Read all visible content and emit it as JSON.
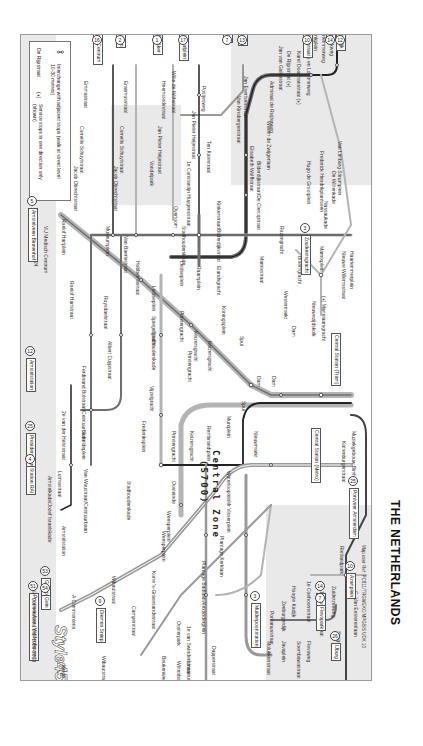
{
  "country_title": "THE NETHERLANDS",
  "zone_label": "Central Zone",
  "zone_code": "(5700)",
  "map_reference": "Map user Ref: PC811/TRGWEKC/MPGB/S UDK 10",
  "legend": {
    "interchange_icon": "interchange-icon",
    "interchange_text": "Interchange with adjacent stops (walk at street level 10-30 metres)",
    "one_direction_example": "De Rijpstraat",
    "one_direction_marker": "(+)",
    "one_direction_text": "Service stops in one direction only (shown)"
  },
  "credit": {
    "company": "A Commenteris",
    "brand": "Style45",
    "brand_suffix": "design",
    "copyright": "© Commenteris Ltd. 1989-2008"
  },
  "terminals": [
    {
      "name": "Station Sloterdijk",
      "line": "12",
      "x": 335,
      "y": 6
    },
    {
      "name": "Sloterweer",
      "line": "14",
      "x": 325,
      "y": 10
    },
    {
      "name": "Van Hallstraat",
      "line": "10",
      "x": 302,
      "y": 20
    },
    {
      "name": "Zoutkeetsgracht",
      "line": "3",
      "x": 300,
      "y": 232
    },
    {
      "name": "Geuzenveld",
      "line": "13",
      "x": 237,
      "y": 12
    },
    {
      "name": "Slotermeer",
      "line": "7",
      "x": 222,
      "y": 12
    },
    {
      "name": "Osdorp Dijkgraafplein",
      "line": "17",
      "x": 178,
      "y": 6
    },
    {
      "name": "Osdorp De Aker",
      "line": "1",
      "x": 152,
      "y": 12
    },
    {
      "name": "Nieuw Sloten",
      "line": "2",
      "x": 115,
      "y": 12
    },
    {
      "name": "VU Medisch Centrum",
      "line": "16",
      "x": 92,
      "y": 10
    },
    {
      "name": "Amstelveen Binnenhof",
      "line": "5",
      "x": 27,
      "y": 205
    },
    {
      "name": "Amstelstation",
      "line": "12",
      "x": 25,
      "y": 355
    },
    {
      "name": "President Kennedylaan",
      "line": "25",
      "x": 25,
      "y": 430
    },
    {
      "name": "Station RAI",
      "line": "4",
      "x": 25,
      "y": 463
    },
    {
      "name": "Gaasperplas",
      "line": "53",
      "x": 40,
      "y": 575
    },
    {
      "name": "Gein",
      "line": "54",
      "x": 40,
      "y": 592
    },
    {
      "name": "Poortwachter (Middenhoven)",
      "line": "51",
      "x": 28,
      "y": 590
    },
    {
      "name": "Diemen Sniep",
      "line": "9",
      "x": 95,
      "y": 605
    },
    {
      "name": "Muiderpoortstation",
      "line": "3",
      "x": 250,
      "y": 600
    },
    {
      "name": "Flevopark",
      "line": "14",
      "x": 315,
      "y": 590
    },
    {
      "name": "Flevopark",
      "line": "7",
      "x": 315,
      "y": 602
    },
    {
      "name": "IJburg",
      "line": "26",
      "x": 330,
      "y": 640
    },
    {
      "name": "Azartplein",
      "line": "10",
      "x": 345,
      "y": 570
    },
    {
      "name": "Pontveer Amsterdam",
      "line": "25",
      "x": 348,
      "y": 485
    },
    {
      "name": "Central Station (Tram)",
      "line": "",
      "x": 330,
      "y": 330
    },
    {
      "name": "Central Station (Metro)",
      "line": "",
      "x": 310,
      "y": 425
    }
  ],
  "stations": [
    {
      "name": "Kingbeekweg",
      "x": 328,
      "y": 25
    },
    {
      "name": "Haarlemmerweg",
      "x": 320,
      "y": 25
    },
    {
      "name": "Willinkplein",
      "x": 312,
      "y": 25
    },
    {
      "name": "Bos en Lommerweg",
      "x": 305,
      "y": 50
    },
    {
      "name": "Karel Doormanstraat (+)",
      "x": 295,
      "y": 50
    },
    {
      "name": "De Rijpstraat (+)",
      "x": 285,
      "y": 50
    },
    {
      "name": "Jan van Galenstraat",
      "x": 277,
      "y": 45
    },
    {
      "name": "Admiraal de Ruijterweg",
      "x": 268,
      "y": 80
    },
    {
      "name": "Willem de Zwijgerlaan",
      "x": 265,
      "y": 120
    },
    {
      "name": "Bilderdijkstraat/De Clercqstraat",
      "x": 255,
      "y": 160
    },
    {
      "name": "Jan Evertsenstraat",
      "x": 242,
      "y": 75
    },
    {
      "name": "Van Kinsbergenstraat",
      "x": 235,
      "y": 95
    },
    {
      "name": "Elisabeth Wolffstraat",
      "x": 248,
      "y": 145
    },
    {
      "name": "Van Limburg Stirumplein",
      "x": 336,
      "y": 140
    },
    {
      "name": "De Wittenkade",
      "x": 330,
      "y": 170
    },
    {
      "name": "Frederick Hendrikplantsoen",
      "x": 318,
      "y": 150
    },
    {
      "name": "Hugo de Grootplein",
      "x": 305,
      "y": 160
    },
    {
      "name": "Nassaukade",
      "x": 322,
      "y": 200
    },
    {
      "name": "Marnixplein",
      "x": 318,
      "y": 245
    },
    {
      "name": "Haarlemmerplein",
      "x": 348,
      "y": 250
    },
    {
      "name": "Nieuwe Willemsstraat",
      "x": 340,
      "y": 250
    },
    {
      "name": "Rozengracht",
      "x": 278,
      "y": 225
    },
    {
      "name": "Bloemgracht",
      "x": 296,
      "y": 255
    },
    {
      "name": "Marnixstraat",
      "x": 258,
      "y": 255
    },
    {
      "name": "(+) Martelaarsgracht",
      "x": 320,
      "y": 295
    },
    {
      "name": "Nieuwezijdskolk",
      "x": 310,
      "y": 300
    },
    {
      "name": "Westermarkt",
      "x": 282,
      "y": 290
    },
    {
      "name": "Dam",
      "x": 290,
      "y": 325
    },
    {
      "name": "Dam",
      "x": 270,
      "y": 375
    },
    {
      "name": "Dam",
      "x": 255,
      "y": 375
    },
    {
      "name": "Spui",
      "x": 238,
      "y": 335
    },
    {
      "name": "Spui",
      "x": 240,
      "y": 400
    },
    {
      "name": "Nieuwmarkt",
      "x": 252,
      "y": 430
    },
    {
      "name": "Mr Visserplein",
      "x": 225,
      "y": 500
    },
    {
      "name": "Kattenburgerstraat",
      "x": 340,
      "y": 440
    },
    {
      "name": "Muziekgebouw Bimhuis",
      "x": 350,
      "y": 430
    },
    {
      "name": "Rietlandpark",
      "x": 338,
      "y": 545
    },
    {
      "name": "C. Van Eesterenlaan",
      "x": 352,
      "y": 590
    },
    {
      "name": "Zuiderzeeweg",
      "x": 330,
      "y": 585
    },
    {
      "name": "1e Leeghwaterstraat",
      "x": 318,
      "y": 590
    },
    {
      "name": "Steigereiland",
      "x": 335,
      "y": 630
    },
    {
      "name": "1e Coehoornstraat",
      "x": 305,
      "y": 580
    },
    {
      "name": "Hoogte Kadijk",
      "x": 290,
      "y": 585
    },
    {
      "name": "Zeeburgerdijk",
      "x": 280,
      "y": 600
    },
    {
      "name": "Pontanusstraat",
      "x": 268,
      "y": 610
    },
    {
      "name": "Soembawastraat",
      "x": 295,
      "y": 640
    },
    {
      "name": "Javaplein",
      "x": 280,
      "y": 640
    },
    {
      "name": "Molukkenstraat",
      "x": 265,
      "y": 640
    },
    {
      "name": "Flevoweg",
      "x": 305,
      "y": 640
    },
    {
      "name": "Dapperstraat",
      "x": 210,
      "y": 645
    },
    {
      "name": "Linnaeusstraat",
      "x": 185,
      "y": 660
    },
    {
      "name": "Wittenbachstraat",
      "x": 175,
      "y": 660
    },
    {
      "name": "Beukenweg",
      "x": 160,
      "y": 655
    },
    {
      "name": "Oosterpark",
      "x": 175,
      "y": 620
    },
    {
      "name": "1e van Swindenstraat",
      "x": 185,
      "y": 625
    },
    {
      "name": "Alexanderplein",
      "x": 200,
      "y": 600
    },
    {
      "name": "Plantage Badlaan",
      "x": 200,
      "y": 560
    },
    {
      "name": "Plantage Kerklaan",
      "x": 218,
      "y": 535
    },
    {
      "name": "Waterlooplein",
      "x": 225,
      "y": 470
    },
    {
      "name": "Weesperplein",
      "x": 160,
      "y": 530
    },
    {
      "name": "Weesperplein",
      "x": 165,
      "y": 510
    },
    {
      "name": "Oosteinde",
      "x": 170,
      "y": 480
    },
    {
      "name": "Korte 's-Gravesandestraat",
      "x": 150,
      "y": 570
    },
    {
      "name": "Camperstraat",
      "x": 130,
      "y": 605
    },
    {
      "name": "Wibautstraat",
      "x": 110,
      "y": 575
    },
    {
      "name": "Wibautstraat",
      "x": 100,
      "y": 655
    },
    {
      "name": "Amstelstation",
      "x": 60,
      "y": 525
    },
    {
      "name": "Van Woustraat/Ceintuurbaan",
      "x": 82,
      "y": 468
    },
    {
      "name": "Amstelkade/Jozef Israelskade",
      "x": 46,
      "y": 475
    },
    {
      "name": "Lutmastraat",
      "x": 56,
      "y": 470
    },
    {
      "name": "Scheldeplein",
      "x": 80,
      "y": 430
    },
    {
      "name": "2e van der Helststraat",
      "x": 60,
      "y": 410
    },
    {
      "name": "Ferdinand Bolstraat/Ceintuurbaan",
      "x": 80,
      "y": 365
    },
    {
      "name": "Albert Cuypstraat",
      "x": 106,
      "y": 340
    },
    {
      "name": "Ruysdaelstraat",
      "x": 102,
      "y": 295
    },
    {
      "name": "Roelof Hartplein",
      "x": 60,
      "y": 218
    },
    {
      "name": "Roelof Hartstraat",
      "x": 68,
      "y": 280
    },
    {
      "name": "Museumplein",
      "x": 104,
      "y": 225
    },
    {
      "name": "VU Medisch Centrum",
      "x": 42,
      "y": 225
    },
    {
      "name": "Stadhouderskade",
      "x": 150,
      "y": 330
    },
    {
      "name": "Stadhouderskade",
      "x": 180,
      "y": 225
    },
    {
      "name": "Stadhouderskade",
      "x": 125,
      "y": 480
    },
    {
      "name": "Van Baerlestraat",
      "x": 122,
      "y": 235
    },
    {
      "name": "Hobbemastraat",
      "x": 134,
      "y": 260
    },
    {
      "name": "Leidseplein",
      "x": 150,
      "y": 285
    },
    {
      "name": "Leidseplein",
      "x": 178,
      "y": 260
    },
    {
      "name": "Spiegelgracht",
      "x": 150,
      "y": 315
    },
    {
      "name": "Raamplein",
      "x": 195,
      "y": 265
    },
    {
      "name": "Elandsgracht",
      "x": 215,
      "y": 265
    },
    {
      "name": "Kinkerstraat/Bilderdijkstraat",
      "x": 215,
      "y": 200
    },
    {
      "name": "Overtoom",
      "x": 172,
      "y": 205
    },
    {
      "name": "Prinsengracht",
      "x": 178,
      "y": 310
    },
    {
      "name": "Keizersgracht",
      "x": 192,
      "y": 330
    },
    {
      "name": "Keizersgracht",
      "x": 206,
      "y": 340
    },
    {
      "name": "Prinsengracht",
      "x": 186,
      "y": 350
    },
    {
      "name": "Koningsplein",
      "x": 220,
      "y": 305
    },
    {
      "name": "Vijzelgracht",
      "x": 148,
      "y": 385
    },
    {
      "name": "Frederiksplein",
      "x": 140,
      "y": 420
    },
    {
      "name": "Muntplein",
      "x": 225,
      "y": 415
    },
    {
      "name": "Rembrandtplein",
      "x": 205,
      "y": 425
    },
    {
      "name": "Keizersgracht",
      "x": 188,
      "y": 430
    },
    {
      "name": "Prinsengracht",
      "x": 170,
      "y": 430
    },
    {
      "name": "Ten Katestraat",
      "x": 205,
      "y": 140
    },
    {
      "name": "1e Constantijn Huygensstraat",
      "x": 185,
      "y": 160
    },
    {
      "name": "Jan Pieter Heijestraat",
      "x": 190,
      "y": 110
    },
    {
      "name": "Postjesweg",
      "x": 200,
      "y": 85
    },
    {
      "name": "Witte de Withstraat",
      "x": 170,
      "y": 70
    },
    {
      "name": "Jan Pieter Heijestraat",
      "x": 156,
      "y": 125
    },
    {
      "name": "Heemstedestraat",
      "x": 160,
      "y": 80
    },
    {
      "name": "Vondelpark",
      "x": 148,
      "y": 160
    },
    {
      "name": "Erasmusstraat",
      "x": 122,
      "y": 80
    },
    {
      "name": "Cornelis Schuytstraat",
      "x": 118,
      "y": 125
    },
    {
      "name": "Jacob Obrechtstraat",
      "x": 112,
      "y": 165
    },
    {
      "name": "Emmastraat",
      "x": 82,
      "y": 80
    },
    {
      "name": "Cornelis Schuytstraat",
      "x": 78,
      "y": 125
    },
    {
      "name": "Jacob Obrechtstraat",
      "x": 72,
      "y": 165
    },
    {
      "name": "24",
      "x": 32,
      "y": 260
    }
  ],
  "interchange_line_numbers": [
    "13",
    "1",
    "2",
    "17",
    "5",
    "14",
    "4",
    "24",
    "9",
    "26",
    "51",
    "53",
    "54"
  ],
  "colors": {
    "tram_dark": "#222222",
    "tram_mid": "#6f6f6f",
    "tram_light": "#b4b4b4",
    "shade": "#e9e9e9",
    "frame": "#9a9a9a"
  }
}
